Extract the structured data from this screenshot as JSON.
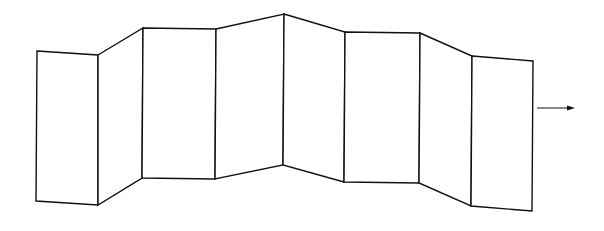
{
  "diagram": {
    "type": "folding-screen",
    "panel_count": 8,
    "stroke_color": "#111111",
    "fill_color": "#ffffff",
    "background_color": "#ffffff",
    "arrow": {
      "direction": "right",
      "icon": "arrow-right-icon"
    }
  }
}
